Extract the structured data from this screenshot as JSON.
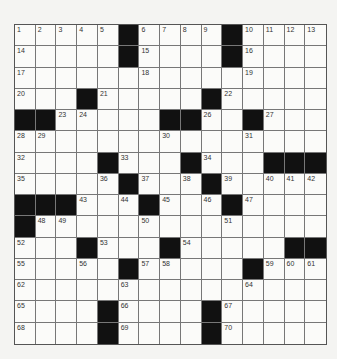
{
  "puzzle": {
    "rows": 15,
    "cols": 15,
    "colors": {
      "block": "#111111",
      "cell": "#fbfbf9",
      "line": "#777777"
    },
    "grid": [
      "....._...._....",
      "....._...._....",
      "...............",
      "..._....._.....",
      "__.....__.._...",
      "..............._",
      "...._..._...___",
      "....._..._.....",
      "___..._..._....",
      "_..............",
      "..._..._.....__",
      "....._....._...",
      "...............",
      "...._...._.....",
      "...._...._....."
    ],
    "numbers": [
      {
        "r": 0,
        "c": 0,
        "n": "1"
      },
      {
        "r": 0,
        "c": 1,
        "n": "2"
      },
      {
        "r": 0,
        "c": 2,
        "n": "3"
      },
      {
        "r": 0,
        "c": 3,
        "n": "4"
      },
      {
        "r": 0,
        "c": 4,
        "n": "5"
      },
      {
        "r": 0,
        "c": 6,
        "n": "6"
      },
      {
        "r": 0,
        "c": 7,
        "n": "7"
      },
      {
        "r": 0,
        "c": 8,
        "n": "8"
      },
      {
        "r": 0,
        "c": 9,
        "n": "9"
      },
      {
        "r": 0,
        "c": 11,
        "n": "10"
      },
      {
        "r": 0,
        "c": 12,
        "n": "11"
      },
      {
        "r": 0,
        "c": 13,
        "n": "12"
      },
      {
        "r": 0,
        "c": 14,
        "n": "13"
      },
      {
        "r": 1,
        "c": 0,
        "n": "14"
      },
      {
        "r": 1,
        "c": 6,
        "n": "15"
      },
      {
        "r": 1,
        "c": 11,
        "n": "16"
      },
      {
        "r": 2,
        "c": 0,
        "n": "17"
      },
      {
        "r": 2,
        "c": 6,
        "n": "18"
      },
      {
        "r": 2,
        "c": 11,
        "n": "19"
      },
      {
        "r": 3,
        "c": 0,
        "n": "20"
      },
      {
        "r": 3,
        "c": 4,
        "n": "21"
      },
      {
        "r": 3,
        "c": 10,
        "n": "22"
      },
      {
        "r": 4,
        "c": 2,
        "n": "23"
      },
      {
        "r": 4,
        "c": 3,
        "n": "24"
      },
      {
        "r": 4,
        "c": 8,
        "n": "25"
      },
      {
        "r": 4,
        "c": 9,
        "n": "26"
      },
      {
        "r": 4,
        "c": 12,
        "n": "27"
      },
      {
        "r": 5,
        "c": 0,
        "n": "28"
      },
      {
        "r": 5,
        "c": 1,
        "n": "29"
      },
      {
        "r": 5,
        "c": 7,
        "n": "30"
      },
      {
        "r": 5,
        "c": 11,
        "n": "31"
      },
      {
        "r": 6,
        "c": 0,
        "n": "32"
      },
      {
        "r": 6,
        "c": 5,
        "n": "33"
      },
      {
        "r": 6,
        "c": 9,
        "n": "34"
      },
      {
        "r": 7,
        "c": 0,
        "n": "35"
      },
      {
        "r": 7,
        "c": 4,
        "n": "36"
      },
      {
        "r": 7,
        "c": 6,
        "n": "37"
      },
      {
        "r": 7,
        "c": 8,
        "n": "38"
      },
      {
        "r": 7,
        "c": 10,
        "n": "39"
      },
      {
        "r": 7,
        "c": 12,
        "n": "40"
      },
      {
        "r": 7,
        "c": 13,
        "n": "41"
      },
      {
        "r": 7,
        "c": 14,
        "n": "42"
      },
      {
        "r": 8,
        "c": 3,
        "n": "43"
      },
      {
        "r": 8,
        "c": 5,
        "n": "44"
      },
      {
        "r": 8,
        "c": 7,
        "n": "45"
      },
      {
        "r": 8,
        "c": 9,
        "n": "46"
      },
      {
        "r": 8,
        "c": 11,
        "n": "47"
      },
      {
        "r": 9,
        "c": 1,
        "n": "48"
      },
      {
        "r": 9,
        "c": 2,
        "n": "49"
      },
      {
        "r": 9,
        "c": 6,
        "n": "50"
      },
      {
        "r": 9,
        "c": 10,
        "n": "51"
      },
      {
        "r": 10,
        "c": 0,
        "n": "52"
      },
      {
        "r": 10,
        "c": 4,
        "n": "53"
      },
      {
        "r": 10,
        "c": 8,
        "n": "54"
      },
      {
        "r": 11,
        "c": 0,
        "n": "55"
      },
      {
        "r": 11,
        "c": 3,
        "n": "56"
      },
      {
        "r": 11,
        "c": 6,
        "n": "57"
      },
      {
        "r": 11,
        "c": 7,
        "n": "58"
      },
      {
        "r": 11,
        "c": 12,
        "n": "59"
      },
      {
        "r": 11,
        "c": 13,
        "n": "60"
      },
      {
        "r": 11,
        "c": 14,
        "n": "61"
      },
      {
        "r": 12,
        "c": 0,
        "n": "62"
      },
      {
        "r": 12,
        "c": 5,
        "n": "63"
      },
      {
        "r": 12,
        "c": 11,
        "n": "64"
      },
      {
        "r": 13,
        "c": 0,
        "n": "65"
      },
      {
        "r": 13,
        "c": 5,
        "n": "66"
      },
      {
        "r": 13,
        "c": 10,
        "n": "67"
      },
      {
        "r": 14,
        "c": 0,
        "n": "68"
      },
      {
        "r": 14,
        "c": 5,
        "n": "69"
      },
      {
        "r": 14,
        "c": 10,
        "n": "70"
      }
    ]
  }
}
